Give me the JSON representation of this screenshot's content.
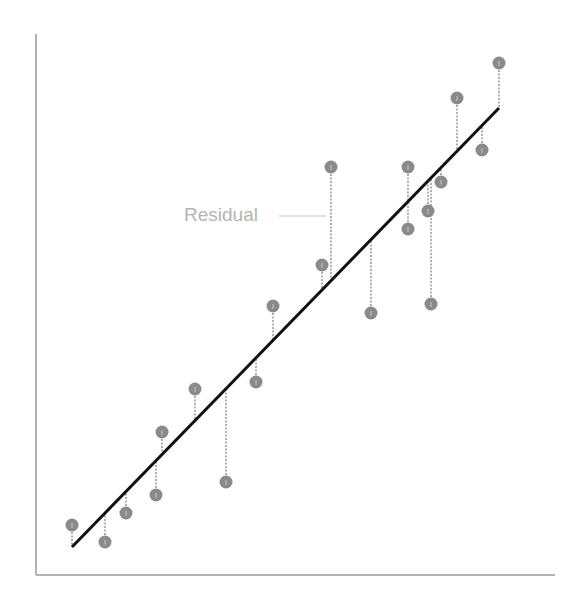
{
  "chart_data": {
    "type": "scatter",
    "title": "",
    "xlabel": "",
    "ylabel": "",
    "grid": false,
    "annotation": "Residual",
    "axes": {
      "x_origin_px": 36,
      "y_origin_px": 575,
      "x_end_px": 555,
      "y_top_px": 34
    },
    "regression_line": {
      "x1": 72,
      "y1": 547,
      "x2": 499,
      "y2": 108
    },
    "points": [
      {
        "x": 72,
        "y": 525
      },
      {
        "x": 105,
        "y": 542
      },
      {
        "x": 126,
        "y": 513
      },
      {
        "x": 156,
        "y": 495
      },
      {
        "x": 162,
        "y": 432
      },
      {
        "x": 195,
        "y": 389
      },
      {
        "x": 226,
        "y": 482
      },
      {
        "x": 256,
        "y": 382
      },
      {
        "x": 273,
        "y": 306
      },
      {
        "x": 322,
        "y": 265
      },
      {
        "x": 331,
        "y": 167
      },
      {
        "x": 371,
        "y": 313
      },
      {
        "x": 408,
        "y": 167
      },
      {
        "x": 408,
        "y": 229
      },
      {
        "x": 428,
        "y": 211
      },
      {
        "x": 431,
        "y": 304
      },
      {
        "x": 441,
        "y": 182
      },
      {
        "x": 457,
        "y": 98
      },
      {
        "x": 482,
        "y": 150
      },
      {
        "x": 499,
        "y": 63
      }
    ],
    "colors": {
      "axis": "#9a9a9a",
      "line": "#111111",
      "point": "#8a8a8a",
      "residual": "#b0b0b0",
      "label": "#b4b4b4"
    }
  },
  "annotation": {
    "label": "Residual"
  }
}
